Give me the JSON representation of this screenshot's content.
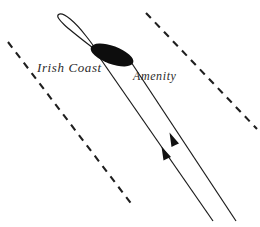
{
  "figure": {
    "background_color": "#ffffff",
    "ink_color": "#1a1a1a",
    "width": 260,
    "height": 227
  },
  "labels": {
    "irish_coast": "Irish Coast",
    "amenity": "Amenity"
  },
  "elements": {
    "vessel_marker": {
      "name": "filled-ellipse-marker",
      "fill": "#0d0d0d",
      "center_x": 112,
      "center_y": 55,
      "radius_x": 22,
      "radius_y": 9,
      "rotation_deg": 20
    },
    "track_loop": {
      "name": "open-loop-track",
      "stroke": "#1a1a1a",
      "stroke_width": 1.1,
      "apex_x": 58,
      "apex_y": 15,
      "tip_x": 93,
      "tip_y": 48
    },
    "solid_tracks": [
      {
        "name": "track-line-left",
        "x1": 93,
        "y1": 48,
        "x2": 213,
        "y2": 221,
        "arrow_at_x": 164,
        "arrow_at_y": 150,
        "arrow_direction": "up-left"
      },
      {
        "name": "track-line-right",
        "x1": 131,
        "y1": 62,
        "x2": 236,
        "y2": 221,
        "arrow_at_x": 172,
        "arrow_at_y": 136,
        "arrow_direction": "up-left"
      }
    ],
    "dashed_lines": [
      {
        "name": "dashed-line-left",
        "x1": 8,
        "y1": 42,
        "x2": 133,
        "y2": 206,
        "dash": "7 6"
      },
      {
        "name": "dashed-line-right",
        "x1": 146,
        "y1": 13,
        "x2": 257,
        "y2": 129,
        "dash": "7 6"
      }
    ]
  }
}
